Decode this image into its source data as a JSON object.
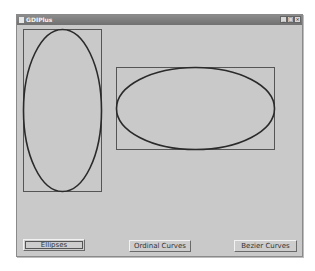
{
  "window": {
    "title": "GDIPlus",
    "controls": {
      "minimize": "_",
      "maximize": "□",
      "close": "×"
    }
  },
  "shapes": [
    {
      "type": "rectangle",
      "x": 7,
      "y": 5,
      "w": 78,
      "h": 162
    },
    {
      "type": "ellipse",
      "cx": 46,
      "cy": 86,
      "rx": 39,
      "ry": 81
    },
    {
      "type": "rectangle",
      "x": 100,
      "y": 43,
      "w": 158,
      "h": 82
    },
    {
      "type": "ellipse",
      "cx": 179,
      "cy": 84,
      "rx": 79,
      "ry": 41
    }
  ],
  "buttons": [
    {
      "label": "Ellipses",
      "focused": true
    },
    {
      "label": "Ordinal Curves",
      "focused": false
    },
    {
      "label": "Bezier Curves",
      "focused": false
    }
  ],
  "colors": {
    "background": "#c9c9c9",
    "stroke_ellipse": "#2a2a2a",
    "stroke_rect": "#555555"
  }
}
